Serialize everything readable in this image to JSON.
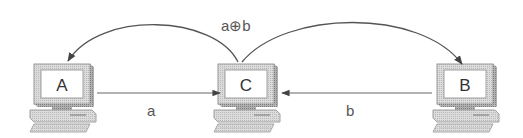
{
  "diagram": {
    "type": "network-flow",
    "nodes": [
      {
        "id": "A",
        "label": "A",
        "x": 30,
        "y": 62
      },
      {
        "id": "C",
        "label": "C",
        "x": 214,
        "y": 62
      },
      {
        "id": "B",
        "label": "B",
        "x": 433,
        "y": 62
      }
    ],
    "edges": [
      {
        "from": "A",
        "to": "C",
        "label": "a",
        "style": "straight"
      },
      {
        "from": "B",
        "to": "C",
        "label": "b",
        "style": "straight"
      },
      {
        "from": "C",
        "to": "A",
        "label": "a⊕b",
        "style": "arc"
      },
      {
        "from": "C",
        "to": "B",
        "label": "a⊕b",
        "style": "arc"
      }
    ],
    "labels": {
      "broadcast": "a⊕b",
      "edge_a": "a",
      "edge_b": "b"
    },
    "colors": {
      "line": "#555555",
      "monitor_face": "#e6e6e6",
      "monitor_edge": "#9a9a9a",
      "screen": "#ffffff"
    }
  }
}
